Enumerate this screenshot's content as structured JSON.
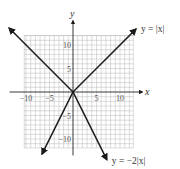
{
  "chart_data": {
    "type": "line",
    "title": "",
    "xlabel": "x",
    "ylabel": "y",
    "xlim": [
      -10.4,
      12.8
    ],
    "ylim": [
      -11.9,
      12.0
    ],
    "grid": true,
    "grid_step": 1,
    "x_ticks": [
      {
        "value": -10,
        "label": "−10"
      },
      {
        "value": -5,
        "label": "−5"
      },
      {
        "value": 5,
        "label": "5"
      },
      {
        "value": 10,
        "label": "10"
      }
    ],
    "y_ticks": [
      {
        "value": 10,
        "label": "10"
      },
      {
        "value": 5,
        "label": "5"
      },
      {
        "value": -5,
        "label": "−5"
      },
      {
        "value": -10,
        "label": "−10"
      }
    ],
    "series": [
      {
        "name": "y = |x|",
        "label": "y = |x|",
        "formula": "abs",
        "coef": 1,
        "x": [
          -13.6,
          0,
          13.4
        ],
        "y": [
          13.6,
          0,
          13.4
        ],
        "arrows": true,
        "label_anchor": "end-right"
      },
      {
        "name": "y = −2|x|",
        "label": "y = −2|x|",
        "formula": "abs",
        "coef": -2,
        "x": [
          -6.6,
          0,
          7.2
        ],
        "y": [
          -13.2,
          0,
          -14.4
        ],
        "arrows": true,
        "label_anchor": "end-right"
      }
    ],
    "legend": "inline-labels"
  }
}
